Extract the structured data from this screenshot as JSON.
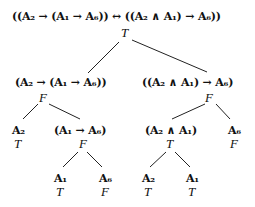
{
  "diagram": {
    "colors": {
      "text": "#111111",
      "edge": "#222222",
      "background": "#ffffff"
    },
    "nodes": {
      "root": {
        "formula": "((A₂ → (A₁ → A₆)) ↔ ((A₂ ∧ A₁) → A₆))",
        "value": "T"
      },
      "left": {
        "formula": "(A₂ → (A₁ → A₆))",
        "value": "F"
      },
      "right": {
        "formula": "((A₂ ∧ A₁) → A₆)",
        "value": "F"
      },
      "ll": {
        "formula": "A₂",
        "value": "T"
      },
      "lr": {
        "formula": "(A₁ → A₆)",
        "value": "F"
      },
      "rl": {
        "formula": "(A₂ ∧ A₁)",
        "value": "T"
      },
      "rr": {
        "formula": "A₆",
        "value": "F"
      },
      "lrl": {
        "formula": "A₁",
        "value": "T"
      },
      "lrr": {
        "formula": "A₆",
        "value": "F"
      },
      "rll": {
        "formula": "A₂",
        "value": "T"
      },
      "rlr": {
        "formula": "A₁",
        "value": "T"
      }
    },
    "edges": [
      {
        "from": "root",
        "to": "left"
      },
      {
        "from": "root",
        "to": "right"
      },
      {
        "from": "left",
        "to": "ll"
      },
      {
        "from": "left",
        "to": "lr"
      },
      {
        "from": "right",
        "to": "rl"
      },
      {
        "from": "right",
        "to": "rr"
      },
      {
        "from": "lr",
        "to": "lrl"
      },
      {
        "from": "lr",
        "to": "lrr"
      },
      {
        "from": "rl",
        "to": "rll"
      },
      {
        "from": "rl",
        "to": "rlr"
      }
    ]
  }
}
